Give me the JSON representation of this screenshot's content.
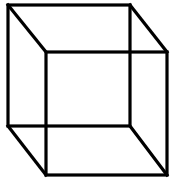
{
  "figure": {
    "type": "necker-cube",
    "stroke_color": "#000000",
    "background": "#ffffff",
    "stroke_width": 3,
    "back_face": {
      "x1": 8,
      "y1": 5,
      "x2": 130,
      "y2": 126
    },
    "front_face": {
      "x1": 46,
      "y1": 52,
      "x2": 167,
      "y2": 175
    }
  }
}
